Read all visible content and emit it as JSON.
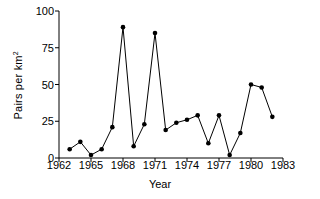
{
  "chart_data": {
    "type": "line",
    "title": "",
    "xlabel": "Year",
    "ylabel": "Pairs per km2",
    "ylabel_base": "Pairs per km",
    "ylabel_sup": "2",
    "xlim": [
      1962,
      1983
    ],
    "ylim": [
      0,
      100
    ],
    "xticks": [
      1962,
      1965,
      1968,
      1971,
      1974,
      1977,
      1980,
      1983
    ],
    "yticks": [
      0,
      25,
      50,
      75,
      100
    ],
    "grid": false,
    "legend": false,
    "marker": "filled-circle",
    "line_color": "#000000",
    "marker_color": "#000000",
    "background": "#ffffff",
    "x": [
      1963,
      1964,
      1965,
      1966,
      1967,
      1968,
      1969,
      1970,
      1971,
      1972,
      1973,
      1974,
      1975,
      1976,
      1977,
      1978,
      1979,
      1980,
      1981,
      1982
    ],
    "values": [
      6,
      11,
      2,
      6,
      21,
      89,
      8,
      23,
      85,
      19,
      24,
      26,
      29,
      10,
      29,
      2,
      17,
      50,
      48,
      28
    ],
    "series": [
      {
        "name": "Pairs per km2",
        "points": [
          {
            "x": 1963,
            "y": 6
          },
          {
            "x": 1964,
            "y": 11
          },
          {
            "x": 1965,
            "y": 2
          },
          {
            "x": 1966,
            "y": 6
          },
          {
            "x": 1967,
            "y": 21
          },
          {
            "x": 1968,
            "y": 89
          },
          {
            "x": 1969,
            "y": 8
          },
          {
            "x": 1970,
            "y": 23
          },
          {
            "x": 1971,
            "y": 85
          },
          {
            "x": 1972,
            "y": 19
          },
          {
            "x": 1973,
            "y": 24
          },
          {
            "x": 1974,
            "y": 26
          },
          {
            "x": 1975,
            "y": 29
          },
          {
            "x": 1976,
            "y": 10
          },
          {
            "x": 1977,
            "y": 29
          },
          {
            "x": 1978,
            "y": 2
          },
          {
            "x": 1979,
            "y": 17
          },
          {
            "x": 1980,
            "y": 50
          },
          {
            "x": 1981,
            "y": 48
          },
          {
            "x": 1982,
            "y": 28
          }
        ]
      }
    ]
  }
}
